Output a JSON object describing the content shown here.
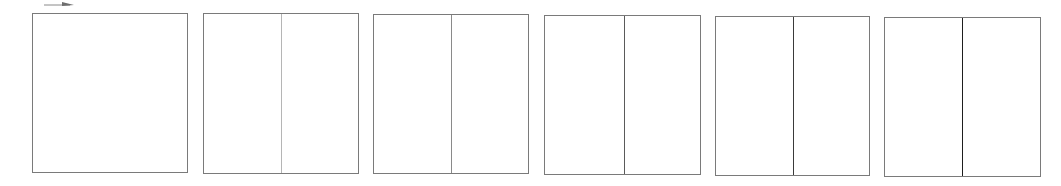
{
  "diagram": {
    "arrow": {
      "direction": "right",
      "color": "#6e6e6e"
    },
    "panels": [
      {
        "id": 1,
        "left": 32,
        "top": 13,
        "width": 156,
        "height": 160,
        "divider": null
      },
      {
        "id": 2,
        "left": 203,
        "top": 13,
        "width": 156,
        "height": 161,
        "divider": {
          "x": 77,
          "color": "#b5b5b5"
        }
      },
      {
        "id": 3,
        "left": 373,
        "top": 14,
        "width": 156,
        "height": 160,
        "divider": {
          "x": 77,
          "color": "#8a8a8a"
        }
      },
      {
        "id": 4,
        "left": 544,
        "top": 15,
        "width": 157,
        "height": 160,
        "divider": {
          "x": 79,
          "color": "#5a5a5a"
        }
      },
      {
        "id": 5,
        "left": 715,
        "top": 16,
        "width": 155,
        "height": 160,
        "divider": {
          "x": 77,
          "color": "#3a3a3a"
        }
      },
      {
        "id": 6,
        "left": 884,
        "top": 17,
        "width": 157,
        "height": 160,
        "divider": {
          "x": 77,
          "color": "#1e1e1e"
        }
      }
    ],
    "border_color": "#7a7a7a"
  }
}
